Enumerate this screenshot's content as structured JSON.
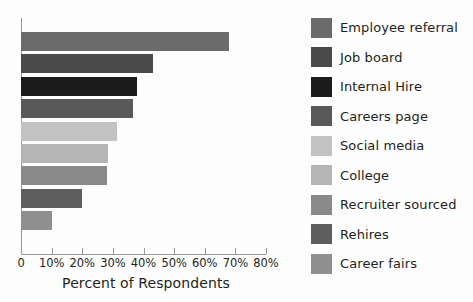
{
  "chart_data": {
    "type": "bar",
    "orientation": "horizontal",
    "title": "",
    "xlabel": "Percent of Respondents",
    "ylabel": "",
    "xlim": [
      0,
      80
    ],
    "xticks": [
      0,
      10,
      20,
      30,
      40,
      50,
      60,
      70,
      80
    ],
    "xticklabels": [
      "0",
      "10%",
      "20%",
      "30%",
      "40%",
      "50%",
      "60%",
      "70%",
      "80%"
    ],
    "yticklabels": [],
    "grid": false,
    "legend_position": "right",
    "categories": [
      "Employee referral",
      "Job board",
      "Internal Hire",
      "Careers page",
      "Social media",
      "College",
      "Recruiter sourced",
      "Rehires",
      "Career fairs"
    ],
    "values": [
      68,
      43,
      38,
      36.5,
      31.5,
      28.5,
      28,
      20,
      10
    ],
    "colors": [
      "#6b6b6b",
      "#4a4a4a",
      "#1c1c1c",
      "#595959",
      "#c2c2c2",
      "#b5b5b5",
      "#8a8a8a",
      "#5e5e5e",
      "#8f8f8f"
    ]
  },
  "legend": {
    "items": [
      {
        "label": "Employee referral",
        "color": "#6b6b6b"
      },
      {
        "label": "Job board",
        "color": "#4a4a4a"
      },
      {
        "label": "Internal Hire",
        "color": "#1c1c1c"
      },
      {
        "label": "Careers page",
        "color": "#595959"
      },
      {
        "label": "Social media",
        "color": "#c2c2c2"
      },
      {
        "label": "College",
        "color": "#b5b5b5"
      },
      {
        "label": "Recruiter sourced",
        "color": "#8a8a8a"
      },
      {
        "label": "Rehires",
        "color": "#5e5e5e"
      },
      {
        "label": "Career fairs",
        "color": "#8f8f8f"
      }
    ]
  },
  "axis": {
    "x_title": "Percent of Respondents",
    "tick_labels": [
      "0",
      "10%",
      "20%",
      "30%",
      "40%",
      "50%",
      "60%",
      "70%",
      "80%"
    ]
  }
}
